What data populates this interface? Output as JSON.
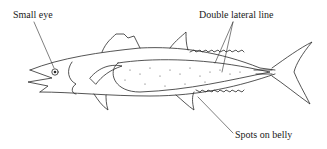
{
  "diagram": {
    "labels": {
      "small_eye": "Small eye",
      "double_lateral_line": "Double lateral line",
      "spots_on_belly": "Spots on belly"
    },
    "colors": {
      "line": "#2a2a2a",
      "text": "#1a1a1a",
      "background": "#ffffff"
    }
  }
}
